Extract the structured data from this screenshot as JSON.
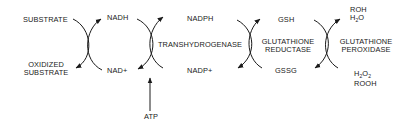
{
  "diagram": {
    "stage1": {
      "left_top": "SUBSTRATE",
      "left_bottom_line1": "OXIDIZED",
      "left_bottom_line2": "SUBSTRATE",
      "right_top": "NADH",
      "right_bottom": "NAD+"
    },
    "stage2": {
      "enzyme": "TRANSHYDROGENASE",
      "top": "NADPH",
      "bottom": "NADP+",
      "input": "ATP"
    },
    "stage3": {
      "enzyme_line1": "GLUTATHIONE",
      "enzyme_line2": "REDUCTASE",
      "top": "GSH",
      "bottom": "GSSG"
    },
    "stage4": {
      "enzyme_line1": "GLUTATHIONE",
      "enzyme_line2": "PEROXIDASE",
      "products_line1": "ROH",
      "products_line2_base": "H",
      "products_line2_sub": "2",
      "products_line2_end": "O",
      "substrates_line1_a": "H",
      "substrates_line1_sub1": "2",
      "substrates_line1_b": "O",
      "substrates_line1_sub2": "2",
      "substrates_line2": "ROOH"
    },
    "colors": {
      "ink": "#1a1a1a",
      "background": "#ffffff"
    }
  }
}
